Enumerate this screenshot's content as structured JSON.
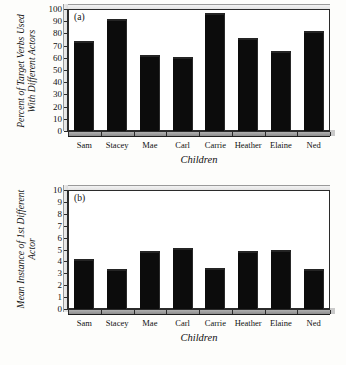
{
  "figure": {
    "background": "#fdfdfb",
    "bar_color": "#0c0c0c",
    "axis_color": "#2b2b2b"
  },
  "chart_data": [
    {
      "type": "bar",
      "panel_label": "(a)",
      "title": "",
      "xlabel": "Children",
      "ylabel": "Percent of Target Verbs Used With Different Actors",
      "ylabel_line1": "Percent of Target Verbs Used",
      "ylabel_line2": "With Different Actors",
      "categories": [
        "Sam",
        "Stacey",
        "Mae",
        "Carl",
        "Carrie",
        "Heather",
        "Elaine",
        "Ned"
      ],
      "values": [
        72,
        90,
        61,
        59,
        95,
        75,
        64,
        80
      ],
      "ylim": [
        0,
        100
      ],
      "ytick_step": 10,
      "yticks": [
        0,
        10,
        20,
        30,
        40,
        50,
        60,
        70,
        80,
        90,
        100
      ],
      "grid": false,
      "legend": null
    },
    {
      "type": "bar",
      "panel_label": "(b)",
      "title": "",
      "xlabel": "Children",
      "ylabel": "Mean Instance of 1st Different Actor",
      "ylabel_line1": "Mean Instance of 1st Different",
      "ylabel_line2": "Actor",
      "categories": [
        "Sam",
        "Stacey",
        "Mae",
        "Carl",
        "Carrie",
        "Heather",
        "Elaine",
        "Ned"
      ],
      "values": [
        4.0,
        3.2,
        4.7,
        5.0,
        3.3,
        4.7,
        4.8,
        3.2
      ],
      "ylim": [
        0,
        10
      ],
      "ytick_step": 1,
      "yticks": [
        0,
        1,
        2,
        3,
        4,
        5,
        6,
        7,
        8,
        9,
        10
      ],
      "grid": false,
      "legend": null
    }
  ]
}
